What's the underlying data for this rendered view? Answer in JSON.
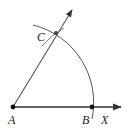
{
  "diagram": {
    "type": "geometric-construction",
    "points": {
      "A": {
        "label": "A",
        "x": 13,
        "y": 107
      },
      "B": {
        "label": "B",
        "x": 92,
        "y": 107
      },
      "C": {
        "label": "C",
        "x": 56,
        "y": 33
      },
      "X": {
        "label": "X"
      }
    },
    "colors": {
      "stroke": "#333333",
      "point": "#111111"
    }
  }
}
